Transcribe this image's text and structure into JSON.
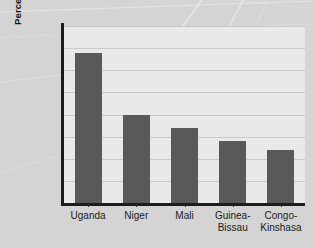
{
  "chart_data": {
    "type": "bar",
    "title": "",
    "subtitle": "",
    "xlabel": "",
    "ylabel": "Percentages of population\nages 0–14",
    "ylabel_line1": "Percentages of population",
    "ylabel_line2": "ages 0–14",
    "categories": [
      "Uganda",
      "Niger",
      "Mali",
      "Guinea-\nBissau",
      "Congo-\nKinshasa"
    ],
    "values": [
      49.4,
      48.0,
      47.7,
      47.4,
      47.2
    ],
    "ylim": [
      46.0,
      50.0
    ],
    "ytick_values": [
      46.0,
      46.5,
      47.0,
      47.5,
      48.0,
      48.5,
      49.0,
      49.5,
      50.0
    ],
    "ytick_labels": [
      "46.0",
      "46.5",
      "47.0",
      "47.5",
      "48.0",
      "48.5",
      "49.0",
      "49.5",
      "50.0"
    ],
    "grid": true,
    "grid_axis": "y",
    "legend": false,
    "legend_position": "none",
    "bar_color": "#595959",
    "plot_background": "#e9e9e9",
    "figure_background": "#d4d4d4",
    "axis_color": "#1c1c1c",
    "grid_color": "#c9c9c9",
    "text_color": "#1a1a1a"
  }
}
